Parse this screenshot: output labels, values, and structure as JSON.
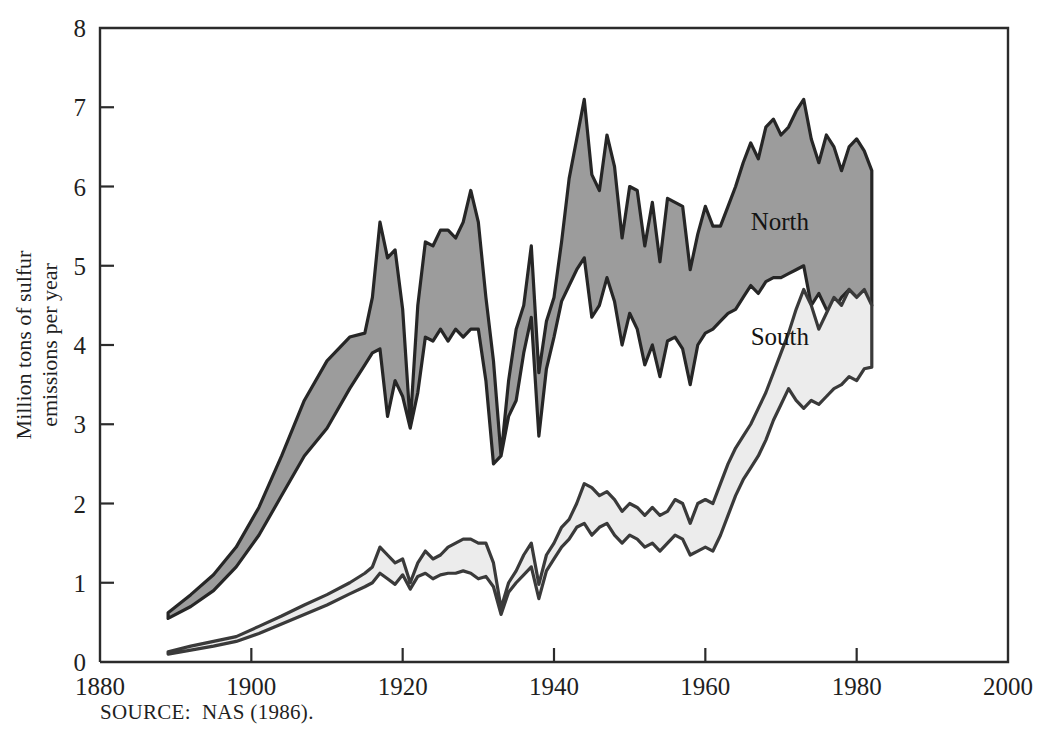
{
  "chart_data": {
    "type": "area",
    "title": "",
    "subtitle": "",
    "xlabel": "",
    "ylabel": "Million tons of sulfur emissions per year",
    "ylabel_line1": "Million tons of sulfur",
    "ylabel_line2": "emissions per year",
    "xlim": [
      1880,
      2000
    ],
    "ylim": [
      0,
      8
    ],
    "xticks": [
      1880,
      1900,
      1920,
      1940,
      1960,
      1980,
      2000
    ],
    "xticklabels": [
      "1880",
      "1900",
      "1920",
      "1940",
      "1960",
      "1980",
      "2000"
    ],
    "yticks": [
      0,
      1,
      2,
      3,
      4,
      5,
      6,
      7,
      8
    ],
    "yticklabels": [
      "0",
      "1",
      "2",
      "3",
      "4",
      "5",
      "6",
      "7",
      "8"
    ],
    "grid": false,
    "legend_position": "inline-annotation",
    "annotations": [
      {
        "text": "North",
        "x": 1966,
        "y": 5.45
      },
      {
        "text": "South",
        "x": 1966,
        "y": 4.0
      }
    ],
    "band_colors": {
      "north_fill": "#9c9c9c",
      "south_fill": "#ececec",
      "outline": "#262626",
      "axis": "#2b2b2b",
      "background": "#ffffff"
    },
    "series": [
      {
        "name": "North upper bound",
        "x": [
          1889,
          1892,
          1895,
          1898,
          1901,
          1904,
          1907,
          1910,
          1913,
          1915,
          1916,
          1917,
          1918,
          1919,
          1920,
          1921,
          1922,
          1923,
          1924,
          1925,
          1926,
          1927,
          1928,
          1929,
          1930,
          1931,
          1932,
          1933,
          1934,
          1935,
          1936,
          1937,
          1938,
          1939,
          1940,
          1941,
          1942,
          1943,
          1944,
          1945,
          1946,
          1947,
          1948,
          1949,
          1950,
          1951,
          1952,
          1953,
          1954,
          1955,
          1956,
          1957,
          1958,
          1959,
          1960,
          1961,
          1962,
          1963,
          1964,
          1965,
          1966,
          1967,
          1968,
          1969,
          1970,
          1971,
          1972,
          1973,
          1974,
          1975,
          1976,
          1977,
          1978,
          1979,
          1980,
          1981,
          1982
        ],
        "values": [
          0.62,
          0.85,
          1.1,
          1.45,
          1.95,
          2.6,
          3.3,
          3.8,
          4.1,
          4.15,
          4.6,
          5.55,
          5.1,
          5.2,
          4.45,
          3.0,
          4.5,
          5.3,
          5.25,
          5.45,
          5.45,
          5.35,
          5.55,
          5.95,
          5.55,
          4.6,
          3.8,
          2.6,
          3.55,
          4.2,
          4.5,
          5.25,
          3.65,
          4.3,
          4.6,
          5.3,
          6.1,
          6.6,
          7.1,
          6.15,
          5.95,
          6.65,
          6.25,
          5.35,
          6.0,
          5.95,
          5.25,
          5.8,
          5.05,
          5.85,
          5.8,
          5.75,
          4.95,
          5.4,
          5.75,
          5.5,
          5.5,
          5.75,
          6.0,
          6.3,
          6.55,
          6.35,
          6.75,
          6.85,
          6.65,
          6.75,
          6.95,
          7.1,
          6.6,
          6.3,
          6.65,
          6.5,
          6.2,
          6.5,
          6.6,
          6.45,
          6.2
        ]
      },
      {
        "name": "North lower bound (South upper bound)",
        "x": [
          1889,
          1892,
          1895,
          1898,
          1901,
          1904,
          1907,
          1910,
          1913,
          1915,
          1916,
          1917,
          1918,
          1919,
          1920,
          1921,
          1922,
          1923,
          1924,
          1925,
          1926,
          1927,
          1928,
          1929,
          1930,
          1931,
          1932,
          1933,
          1934,
          1935,
          1936,
          1937,
          1938,
          1939,
          1940,
          1941,
          1942,
          1943,
          1944,
          1945,
          1946,
          1947,
          1948,
          1949,
          1950,
          1951,
          1952,
          1953,
          1954,
          1955,
          1956,
          1957,
          1958,
          1959,
          1960,
          1961,
          1962,
          1963,
          1964,
          1965,
          1966,
          1967,
          1968,
          1969,
          1970,
          1971,
          1972,
          1973,
          1974,
          1975,
          1976,
          1977,
          1978,
          1979,
          1980,
          1981,
          1982
        ],
        "values": [
          0.55,
          0.7,
          0.9,
          1.2,
          1.6,
          2.1,
          2.6,
          2.95,
          3.45,
          3.75,
          3.9,
          3.95,
          3.1,
          3.55,
          3.35,
          2.95,
          3.4,
          4.1,
          4.05,
          4.2,
          4.05,
          4.2,
          4.1,
          4.2,
          4.2,
          3.55,
          2.5,
          2.6,
          3.1,
          3.3,
          3.9,
          4.35,
          2.85,
          3.7,
          4.1,
          4.55,
          4.75,
          4.95,
          5.1,
          4.35,
          4.5,
          4.85,
          4.55,
          4.0,
          4.4,
          4.2,
          3.75,
          4.0,
          3.6,
          4.05,
          4.1,
          3.95,
          3.5,
          4.0,
          4.15,
          4.2,
          4.3,
          4.4,
          4.45,
          4.6,
          4.75,
          4.65,
          4.8,
          4.85,
          4.85,
          4.9,
          4.95,
          5.0,
          4.5,
          4.65,
          4.45,
          4.45,
          4.6,
          4.7,
          4.6,
          4.55,
          4.5
        ]
      },
      {
        "name": "South upper bound",
        "x": [
          1889,
          1892,
          1895,
          1898,
          1901,
          1904,
          1907,
          1910,
          1913,
          1915,
          1916,
          1917,
          1918,
          1919,
          1920,
          1921,
          1922,
          1923,
          1924,
          1925,
          1926,
          1927,
          1928,
          1929,
          1930,
          1931,
          1932,
          1933,
          1934,
          1935,
          1936,
          1937,
          1938,
          1939,
          1940,
          1941,
          1942,
          1943,
          1944,
          1945,
          1946,
          1947,
          1948,
          1949,
          1950,
          1951,
          1952,
          1953,
          1954,
          1955,
          1956,
          1957,
          1958,
          1959,
          1960,
          1961,
          1962,
          1963,
          1964,
          1965,
          1966,
          1967,
          1968,
          1969,
          1970,
          1971,
          1972,
          1973,
          1974,
          1975,
          1976,
          1977,
          1978,
          1979,
          1980,
          1981,
          1982
        ],
        "values": [
          0.13,
          0.2,
          0.26,
          0.32,
          0.45,
          0.58,
          0.72,
          0.85,
          1.0,
          1.12,
          1.2,
          1.45,
          1.35,
          1.25,
          1.3,
          1.0,
          1.25,
          1.4,
          1.3,
          1.35,
          1.45,
          1.5,
          1.55,
          1.55,
          1.5,
          1.5,
          1.25,
          0.68,
          1.0,
          1.15,
          1.35,
          1.5,
          0.98,
          1.35,
          1.5,
          1.7,
          1.8,
          2.0,
          2.25,
          2.2,
          2.1,
          2.15,
          2.05,
          1.9,
          2.0,
          1.95,
          1.85,
          1.95,
          1.85,
          1.9,
          2.05,
          2.0,
          1.75,
          2.0,
          2.05,
          2.0,
          2.25,
          2.5,
          2.7,
          2.85,
          3.0,
          3.2,
          3.4,
          3.65,
          3.9,
          4.15,
          4.45,
          4.7,
          4.5,
          4.2,
          4.4,
          4.6,
          4.5,
          4.7,
          4.6,
          4.7,
          4.5
        ]
      },
      {
        "name": "South lower bound",
        "x": [
          1889,
          1892,
          1895,
          1898,
          1901,
          1904,
          1907,
          1910,
          1913,
          1915,
          1916,
          1917,
          1918,
          1919,
          1920,
          1921,
          1922,
          1923,
          1924,
          1925,
          1926,
          1927,
          1928,
          1929,
          1930,
          1931,
          1932,
          1933,
          1934,
          1935,
          1936,
          1937,
          1938,
          1939,
          1940,
          1941,
          1942,
          1943,
          1944,
          1945,
          1946,
          1947,
          1948,
          1949,
          1950,
          1951,
          1952,
          1953,
          1954,
          1955,
          1956,
          1957,
          1958,
          1959,
          1960,
          1961,
          1962,
          1963,
          1964,
          1965,
          1966,
          1967,
          1968,
          1969,
          1970,
          1971,
          1972,
          1973,
          1974,
          1975,
          1976,
          1977,
          1978,
          1979,
          1980,
          1981,
          1982
        ],
        "values": [
          0.1,
          0.15,
          0.2,
          0.26,
          0.36,
          0.48,
          0.6,
          0.72,
          0.86,
          0.95,
          1.0,
          1.12,
          1.05,
          0.98,
          1.1,
          0.92,
          1.08,
          1.12,
          1.05,
          1.1,
          1.12,
          1.12,
          1.15,
          1.12,
          1.05,
          1.08,
          0.95,
          0.6,
          0.88,
          1.0,
          1.1,
          1.2,
          0.8,
          1.15,
          1.3,
          1.45,
          1.55,
          1.7,
          1.75,
          1.6,
          1.7,
          1.75,
          1.6,
          1.5,
          1.6,
          1.55,
          1.45,
          1.5,
          1.4,
          1.5,
          1.6,
          1.55,
          1.35,
          1.4,
          1.45,
          1.4,
          1.6,
          1.85,
          2.1,
          2.3,
          2.45,
          2.6,
          2.8,
          3.05,
          3.25,
          3.45,
          3.3,
          3.2,
          3.3,
          3.25,
          3.35,
          3.45,
          3.5,
          3.6,
          3.55,
          3.7,
          3.72
        ]
      }
    ]
  },
  "source": {
    "note": "SOURCE:  NAS (1986)."
  }
}
